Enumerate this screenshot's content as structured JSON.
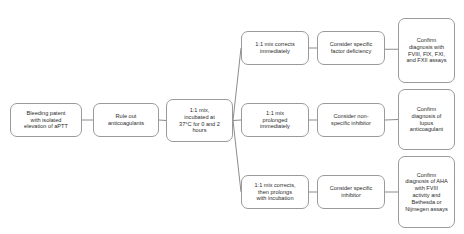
{
  "diagram": {
    "background_color": "#ffffff",
    "node_border_color": "#9a9a9a",
    "edge_color": "#6e6e6e",
    "text_color": "#2b2b2b",
    "nodes": [
      {
        "id": "presentation",
        "label": "Bleeding patent\nwith isolated\nelevation of aPTT",
        "x": 10,
        "y": 103,
        "width": 72,
        "height": 34,
        "font_size": 5.6
      },
      {
        "id": "rule-out-anticoagulants",
        "label": "Rule out\nanticoagulants",
        "x": 93,
        "y": 103,
        "width": 66,
        "height": 34,
        "font_size": 5.6
      },
      {
        "id": "mixing-study",
        "label": "1:1 mix,\nincubated at\n37°C for 0 and 2\nhours",
        "x": 166,
        "y": 99,
        "width": 67,
        "height": 43,
        "font_size": 5.6
      },
      {
        "id": "corrects-immediately",
        "label": "1:1 mix corrects\nimmediately",
        "x": 241,
        "y": 31,
        "width": 68,
        "height": 34,
        "font_size": 5.6
      },
      {
        "id": "prolonged-immediately",
        "label": "1:1 mix\nprolonged\nimmediately",
        "x": 241,
        "y": 103,
        "width": 68,
        "height": 34,
        "font_size": 5.6
      },
      {
        "id": "corrects-then-prolongs",
        "label": "1:1 mix corrects,\nthen prolongs\nwith incubation",
        "x": 241,
        "y": 175,
        "width": 68,
        "height": 34,
        "font_size": 5.6
      },
      {
        "id": "factor-deficiency",
        "label": "Consider specific\nfactor deficiency",
        "x": 317,
        "y": 31,
        "width": 68,
        "height": 34,
        "font_size": 5.6
      },
      {
        "id": "non-specific-inhibitor",
        "label": "Consider non-\nspecific inhibitor",
        "x": 317,
        "y": 103,
        "width": 68,
        "height": 34,
        "font_size": 5.6
      },
      {
        "id": "specific-inhibitor",
        "label": "Consider specific\ninhibitor",
        "x": 317,
        "y": 175,
        "width": 68,
        "height": 34,
        "font_size": 5.6
      },
      {
        "id": "confirm-factor-assays",
        "label": "Confirm\ndiagnosis with\nFVIII, FIX, FXI,\nand FXII assays",
        "x": 398,
        "y": 18,
        "width": 57,
        "height": 65,
        "font_size": 5.6
      },
      {
        "id": "confirm-lupus-anticoagulant",
        "label": "Confirm\ndiagnosis of\nlupus\nanticoagulant",
        "x": 398,
        "y": 89,
        "width": 57,
        "height": 61,
        "font_size": 5.6
      },
      {
        "id": "confirm-aha",
        "label": "Confirm\ndiagnosis of AHA\nwith FVIII\nactivity and\nBethesda or\nNijmegen assays",
        "x": 398,
        "y": 156,
        "width": 57,
        "height": 72,
        "font_size": 5.6
      }
    ],
    "edges": [
      {
        "id": "presentation-to-rule-out",
        "from": "presentation",
        "to": "rule-out-anticoagulants",
        "shape": "straight"
      },
      {
        "id": "rule-out-to-mixing-study",
        "from": "rule-out-anticoagulants",
        "to": "mixing-study",
        "shape": "straight"
      },
      {
        "id": "mixing-study-to-corrects-immediately",
        "from": "mixing-study",
        "to": "corrects-immediately",
        "shape": "diagonal-up"
      },
      {
        "id": "mixing-study-to-prolonged-immediately",
        "from": "mixing-study",
        "to": "prolonged-immediately",
        "shape": "straight"
      },
      {
        "id": "mixing-study-to-corrects-then-prolongs",
        "from": "mixing-study",
        "to": "corrects-then-prolongs",
        "shape": "diagonal-down"
      },
      {
        "id": "corrects-immediately-to-factor-deficiency",
        "from": "corrects-immediately",
        "to": "factor-deficiency",
        "shape": "straight"
      },
      {
        "id": "prolonged-immediately-to-non-specific-inhibitor",
        "from": "prolonged-immediately",
        "to": "non-specific-inhibitor",
        "shape": "straight"
      },
      {
        "id": "corrects-then-prolongs-to-specific-inhibitor",
        "from": "corrects-then-prolongs",
        "to": "specific-inhibitor",
        "shape": "straight"
      },
      {
        "id": "factor-deficiency-to-confirm-factor-assays",
        "from": "factor-deficiency",
        "to": "confirm-factor-assays",
        "shape": "straight"
      },
      {
        "id": "non-specific-inhibitor-to-confirm-lupus",
        "from": "non-specific-inhibitor",
        "to": "confirm-lupus-anticoagulant",
        "shape": "straight"
      },
      {
        "id": "specific-inhibitor-to-confirm-aha",
        "from": "specific-inhibitor",
        "to": "confirm-aha",
        "shape": "straight"
      }
    ]
  }
}
